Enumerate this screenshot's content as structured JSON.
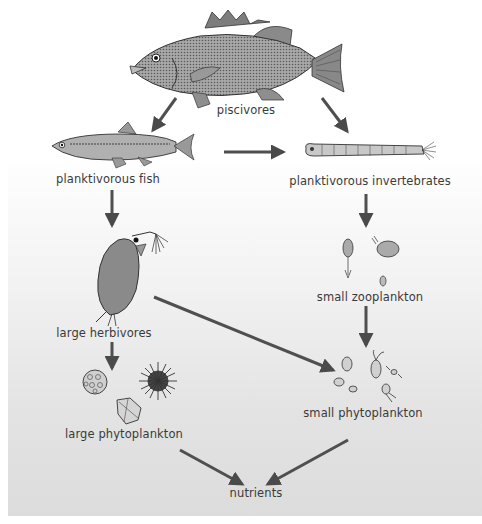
{
  "diagram": {
    "type": "food-web",
    "background": {
      "top": "#ffffff",
      "bottom": "#dcdcdc"
    },
    "arrow_color": "#555555",
    "nodes": [
      {
        "id": "piscivores",
        "label": "piscivores",
        "icon": "largemouth-bass"
      },
      {
        "id": "planktivorous_fish",
        "label": "planktivorous fish",
        "icon": "minnow"
      },
      {
        "id": "planktivorous_invertebrates",
        "label": "planktivorous invertebrates",
        "icon": "phantom-midge-larva"
      },
      {
        "id": "large_herbivores",
        "label": "large herbivores",
        "icon": "daphnia"
      },
      {
        "id": "small_zooplankton",
        "label": "small zooplankton",
        "icon": "copepod-rotifer"
      },
      {
        "id": "large_phytoplankton",
        "label": "large phytoplankton",
        "icon": "colonial-algae"
      },
      {
        "id": "small_phytoplankton",
        "label": "small phytoplankton",
        "icon": "flagellates"
      },
      {
        "id": "nutrients",
        "label": "nutrients",
        "icon": "none"
      }
    ],
    "edges": [
      {
        "from": "piscivores",
        "to": "planktivorous_fish"
      },
      {
        "from": "piscivores",
        "to": "planktivorous_invertebrates"
      },
      {
        "from": "planktivorous_fish",
        "to": "planktivorous_invertebrates"
      },
      {
        "from": "planktivorous_fish",
        "to": "large_herbivores"
      },
      {
        "from": "planktivorous_invertebrates",
        "to": "small_zooplankton"
      },
      {
        "from": "large_herbivores",
        "to": "large_phytoplankton"
      },
      {
        "from": "large_herbivores",
        "to": "small_phytoplankton"
      },
      {
        "from": "small_zooplankton",
        "to": "small_phytoplankton"
      },
      {
        "from": "large_phytoplankton",
        "to": "nutrients"
      },
      {
        "from": "small_phytoplankton",
        "to": "nutrients"
      }
    ]
  }
}
